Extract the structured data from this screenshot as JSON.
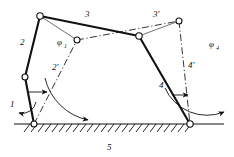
{
  "figure": {
    "type": "kinematic-diagram",
    "background_color": "#ffffff",
    "stroke_color": "#111111"
  },
  "labels": {
    "link1": "1",
    "link2": "2",
    "link2_prime": "2'",
    "link3": "3",
    "link3_prime": "3'",
    "link4": "4",
    "link4_prime": "4'",
    "link5": "5",
    "phi1": "φ",
    "phi1_sub": "1",
    "phi4": "φ",
    "phi4_sub": "4"
  },
  "geometry": {
    "joints": [
      {
        "name": "ground-pivot-left",
        "x": 34,
        "y": 124
      },
      {
        "name": "crank-top-left",
        "x": 25,
        "y": 77
      },
      {
        "name": "coupler-left-top",
        "x": 40,
        "y": 16
      },
      {
        "name": "coupler-mid-right",
        "x": 139,
        "y": 36
      },
      {
        "name": "coupler-prime-left",
        "x": 77,
        "y": 40
      },
      {
        "name": "coupler-prime-right",
        "x": 179,
        "y": 21
      },
      {
        "name": "ground-pivot-right",
        "x": 190,
        "y": 124
      }
    ],
    "solid_links": [
      {
        "name": "link-1-crank",
        "from": [
          34,
          124
        ],
        "to": [
          25,
          77
        ]
      },
      {
        "name": "link-2-rocker",
        "from": [
          25,
          77
        ],
        "to": [
          40,
          16
        ]
      },
      {
        "name": "link-3-coupler",
        "from": [
          40,
          16
        ],
        "to": [
          139,
          36
        ]
      },
      {
        "name": "link-4-rocker",
        "from": [
          139,
          36
        ],
        "to": [
          190,
          124
        ]
      },
      {
        "name": "link-5-frame",
        "from": [
          34,
          124
        ],
        "to": [
          190,
          124
        ]
      }
    ],
    "dashdot_links": [
      {
        "name": "link-2-prime",
        "from": [
          34,
          124
        ],
        "to": [
          77,
          40
        ]
      },
      {
        "name": "link-3-prime",
        "from": [
          77,
          40
        ],
        "to": [
          179,
          21
        ]
      },
      {
        "name": "link-4-prime",
        "from": [
          179,
          21
        ],
        "to": [
          190,
          124
        ]
      }
    ],
    "thin_links": [
      {
        "name": "thin-tie-left",
        "from": [
          40,
          16
        ],
        "to": [
          77,
          40
        ]
      },
      {
        "name": "thin-tie-right",
        "from": [
          139,
          36
        ],
        "to": [
          179,
          21
        ]
      }
    ],
    "ground_line": {
      "x1": 14,
      "y1": 124,
      "x2": 224,
      "y2": 124
    },
    "hatch": {
      "x_start": 30,
      "x_end": 196,
      "spacing": 7,
      "length": 8,
      "angle_deg": 45
    },
    "angle_arcs": [
      {
        "name": "phi1-arc",
        "center": [
          34,
          124
        ],
        "radius": 56,
        "start_deg": 0,
        "end_deg": 101
      },
      {
        "name": "phi4-arc",
        "center": [
          190,
          124
        ],
        "radius": 46,
        "start_deg": 0,
        "end_deg": 99
      }
    ]
  },
  "label_positions": {
    "link1": [
      10,
      107
    ],
    "link2": [
      20,
      45
    ],
    "link2_prime": [
      52,
      70
    ],
    "link3": [
      85,
      17
    ],
    "link3_prime": [
      153,
      17
    ],
    "link4": [
      159,
      88
    ],
    "link4_prime": [
      188,
      68
    ],
    "link5": [
      107,
      150
    ],
    "phi1": [
      57,
      45
    ],
    "phi4": [
      209,
      47
    ]
  }
}
